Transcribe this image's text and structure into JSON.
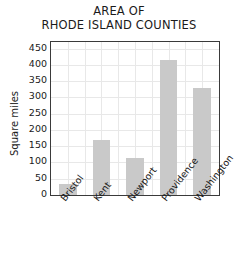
{
  "chart_data": {
    "type": "bar",
    "title": "AREA OF RHODE ISLAND COUNTIES",
    "title_lines": [
      "AREA OF",
      "RHODE ISLAND COUNTIES"
    ],
    "xlabel": "",
    "ylabel": "Square miles",
    "ylim": [
      0,
      470
    ],
    "ytick_values": [
      0,
      50,
      100,
      150,
      200,
      250,
      300,
      350,
      400,
      450
    ],
    "ytick_labels": [
      "0",
      "50",
      "100",
      "150",
      "200",
      "250",
      "300",
      "350",
      "400",
      "450"
    ],
    "categories": [
      "Bristol",
      "Kent",
      "Newport",
      "Providence",
      "Washington"
    ],
    "values": [
      35,
      168,
      113,
      415,
      330
    ],
    "grid": true,
    "grid_color": "#e8e8e8",
    "legend": "none",
    "bar_color": "#c9c9c9",
    "axis_color": "#3a3a3a",
    "text_color": "#1a1a1a",
    "background": "#ffffff",
    "xtick_rotation": -52
  }
}
